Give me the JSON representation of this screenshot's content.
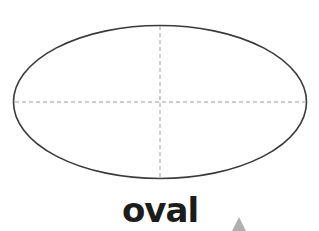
{
  "diagram": {
    "shape_name": "oval",
    "label": "oval",
    "colors": {
      "outline": "#3a3a3a",
      "guides": "#9a9a9a",
      "marker": "#b0b0b0",
      "background": "#ffffff"
    }
  }
}
